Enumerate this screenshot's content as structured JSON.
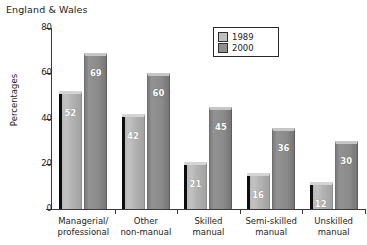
{
  "chart_data": {
    "type": "bar",
    "title": "England & Wales",
    "xlabel": "",
    "ylabel": "Percentages",
    "ylim": [
      0,
      80
    ],
    "yticks": [
      0,
      20,
      40,
      60,
      80
    ],
    "grid": false,
    "legend_position": "top-center",
    "categories": [
      {
        "line1": "Managerial/",
        "line2": "professional"
      },
      {
        "line1": "Other",
        "line2": "non-manual"
      },
      {
        "line1": "Skilled",
        "line2": "manual"
      },
      {
        "line1": "Semi-skilled",
        "line2": "manual"
      },
      {
        "line1": "Unskilled",
        "line2": "manual"
      }
    ],
    "series": [
      {
        "name": "1989",
        "color": "#b8b8b8",
        "values": [
          52,
          42,
          21,
          16,
          12
        ]
      },
      {
        "name": "2000",
        "color": "#8c8c8c",
        "values": [
          69,
          60,
          45,
          36,
          30
        ]
      }
    ]
  },
  "legend": {
    "items": [
      {
        "label": "1989",
        "swatch": "legend-swatch-1989"
      },
      {
        "label": "2000",
        "swatch": "legend-swatch-2000"
      }
    ]
  }
}
